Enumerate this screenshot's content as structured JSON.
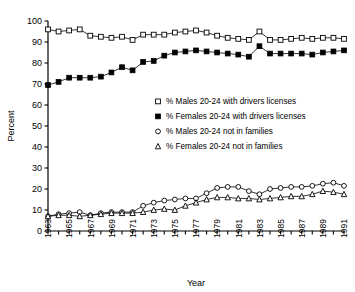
{
  "chart_data": {
    "type": "line",
    "title": "",
    "xlabel": "Year",
    "ylabel": "Percent",
    "xlim": [
      1963,
      1991
    ],
    "ylim": [
      0,
      100
    ],
    "ytick_step": 10,
    "xtick_step": 1,
    "xtick_label_step": 2,
    "grid": false,
    "legend_position": "center",
    "yticks": [
      "0",
      "10",
      "20",
      "30",
      "40",
      "50",
      "60",
      "70",
      "80",
      "90",
      "100"
    ],
    "xticks": [
      1963,
      1964,
      1965,
      1966,
      1967,
      1968,
      1969,
      1970,
      1971,
      1972,
      1973,
      1974,
      1975,
      1976,
      1977,
      1978,
      1979,
      1980,
      1981,
      1982,
      1983,
      1984,
      1985,
      1986,
      1987,
      1988,
      1989,
      1990,
      1991
    ],
    "xtick_labels": [
      "1963",
      "",
      "1965",
      "",
      "1967",
      "",
      "1969",
      "",
      "1971",
      "",
      "1973",
      "",
      "1975",
      "",
      "1977",
      "",
      "1979",
      "",
      "1981",
      "",
      "1983",
      "",
      "1985",
      "",
      "1987",
      "",
      "1989",
      "",
      "1991"
    ],
    "x": [
      1963,
      1964,
      1965,
      1966,
      1967,
      1968,
      1969,
      1970,
      1971,
      1972,
      1973,
      1974,
      1975,
      1976,
      1977,
      1978,
      1979,
      1980,
      1981,
      1982,
      1983,
      1984,
      1985,
      1986,
      1987,
      1988,
      1989,
      1990,
      1991
    ],
    "series": [
      {
        "name": "% Males 20-24 with drivers licenses",
        "marker": "open-square",
        "values": [
          96.0,
          95.0,
          95.5,
          96.0,
          93.0,
          92.5,
          92.0,
          92.5,
          91.0,
          93.5,
          93.5,
          93.5,
          94.5,
          95.0,
          95.5,
          94.5,
          93.0,
          92.0,
          91.5,
          91.0,
          95.0,
          91.0,
          91.0,
          91.5,
          92.0,
          91.5,
          92.0,
          92.0,
          91.5
        ]
      },
      {
        "name": "% Females 20-24 with drivers licenses",
        "marker": "filled-square",
        "values": [
          69.5,
          71.0,
          73.0,
          73.0,
          73.0,
          73.5,
          75.5,
          78.0,
          76.5,
          80.5,
          81.0,
          83.5,
          85.0,
          85.5,
          86.0,
          85.5,
          85.0,
          84.5,
          84.0,
          83.0,
          88.0,
          84.5,
          84.5,
          84.5,
          84.5,
          84.0,
          85.0,
          85.5,
          86.0
        ]
      },
      {
        "name": "% Males 20-24 not in families",
        "marker": "open-circle",
        "values": [
          7.0,
          8.0,
          8.5,
          9.0,
          7.5,
          8.5,
          9.0,
          9.0,
          9.0,
          12.0,
          13.5,
          14.5,
          15.0,
          15.5,
          15.5,
          18.0,
          20.5,
          21.0,
          21.0,
          19.0,
          17.5,
          20.0,
          20.5,
          21.0,
          21.0,
          21.5,
          22.5,
          23.0,
          21.5
        ]
      },
      {
        "name": "% Females 20-24 not in families",
        "marker": "open-triangle",
        "values": [
          7.0,
          7.5,
          7.5,
          7.0,
          7.5,
          8.0,
          8.5,
          8.5,
          8.5,
          9.0,
          10.0,
          10.5,
          10.0,
          12.0,
          13.5,
          15.0,
          16.0,
          16.0,
          15.5,
          15.5,
          15.0,
          15.5,
          16.0,
          16.5,
          16.5,
          17.5,
          19.0,
          18.5,
          17.5
        ]
      }
    ],
    "legend": [
      {
        "label": "% Males 20-24 with drivers licenses",
        "marker": "open-square"
      },
      {
        "label": "% Females 20-24 with drivers licenses",
        "marker": "filled-square"
      },
      {
        "label": "% Males 20-24 not in families",
        "marker": "open-circle"
      },
      {
        "label": "% Females 20-24 not in families",
        "marker": "open-triangle"
      }
    ],
    "colors": {
      "line": "#000000",
      "marker_fill": "#ffffff",
      "marker_edge": "#000000",
      "background": "#ffffff"
    }
  }
}
